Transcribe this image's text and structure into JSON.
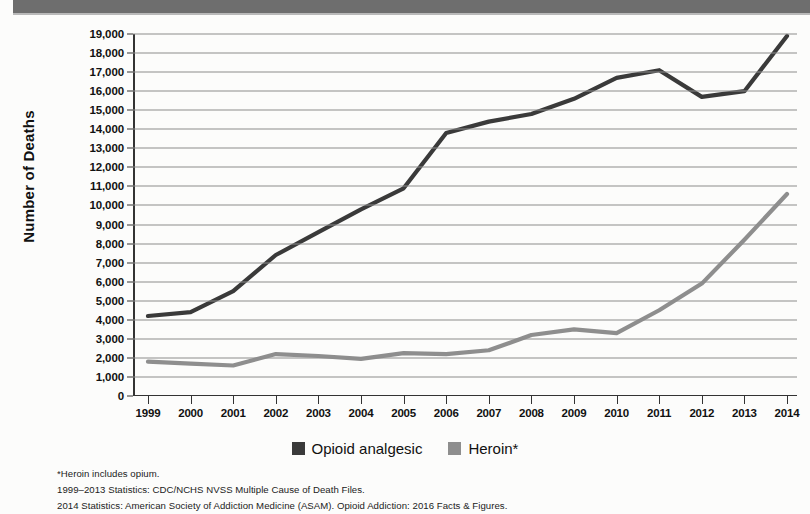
{
  "header": {
    "band_color": "#6e6e6e"
  },
  "chart_data": {
    "type": "line",
    "title": "",
    "xlabel": "",
    "ylabel": "Number of Deaths",
    "x": [
      1999,
      2000,
      2001,
      2002,
      2003,
      2004,
      2005,
      2006,
      2007,
      2008,
      2009,
      2010,
      2011,
      2012,
      2013,
      2014
    ],
    "categories": [
      "1999",
      "2000",
      "2001",
      "2002",
      "2003",
      "2004",
      "2005",
      "2006",
      "2007",
      "2008",
      "2009",
      "2010",
      "2011",
      "2012",
      "2013",
      "2014"
    ],
    "ylim": [
      0,
      19000
    ],
    "ytick_labels": [
      "19,000",
      "18,000",
      "17,000",
      "16,000",
      "15,000",
      "14,000",
      "13,000",
      "12,000",
      "11,000",
      "10,000",
      "9,000",
      "8,000",
      "7,000",
      "6,000",
      "5,000",
      "4,000",
      "3,000",
      "2,000",
      "1,000",
      "0"
    ],
    "yticks": [
      19000,
      18000,
      17000,
      16000,
      15000,
      14000,
      13000,
      12000,
      11000,
      10000,
      9000,
      8000,
      7000,
      6000,
      5000,
      4000,
      3000,
      2000,
      1000,
      0
    ],
    "grid": true,
    "legend_position": "bottom",
    "series": [
      {
        "name": "Opioid analgesic",
        "color": "#3a3a3a",
        "values": [
          4200,
          4400,
          5500,
          7400,
          8600,
          9800,
          10900,
          13800,
          14400,
          14800,
          15600,
          16700,
          17100,
          15700,
          16000,
          18900
        ]
      },
      {
        "name": "Heroin*",
        "color": "#8e8e8e",
        "values": [
          1800,
          1700,
          1600,
          2200,
          2100,
          1950,
          2250,
          2200,
          2400,
          3200,
          3500,
          3300,
          4500,
          5900,
          8200,
          10600
        ]
      }
    ]
  },
  "legend": {
    "items": [
      {
        "label": "Opioid analgesic",
        "color": "#3a3a3a"
      },
      {
        "label": "Heroin*",
        "color": "#8e8e8e"
      }
    ]
  },
  "footnotes": [
    "*Heroin includes opium.",
    "1999–2013 Statistics: CDC/NCHS NVSS Multiple Cause of Death Files.",
    "2014 Statistics: American Society of Addiction Medicine (ASAM). Opioid Addiction: 2016 Facts & Figures."
  ]
}
